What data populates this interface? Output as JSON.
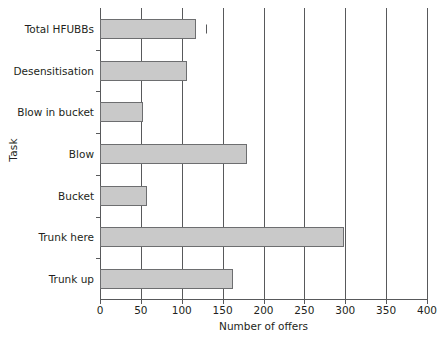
{
  "chart_data": {
    "type": "bar",
    "orientation": "horizontal",
    "title": "",
    "xlabel": "Number of offers",
    "ylabel": "Task",
    "xlim": [
      0,
      400
    ],
    "ylim": null,
    "grid": true,
    "legend": null,
    "categories": [
      "Trunk up",
      "Trunk here",
      "Bucket",
      "Blow",
      "Blow in bucket",
      "Desensitisation",
      "Total HFUBBs"
    ],
    "values": [
      163,
      298,
      57,
      180,
      53,
      107,
      117
    ],
    "xticks": [
      0,
      50,
      100,
      150,
      200,
      250,
      300,
      350,
      400
    ],
    "xticklabels": [
      "0",
      "50",
      "100",
      "150",
      "200",
      "250",
      "300",
      "350",
      "400"
    ],
    "annotations": [
      {
        "name": "tick-mark-total-hfubbs",
        "category": "Total HFUBBs",
        "x": 130,
        "text": ""
      }
    ],
    "colors": {
      "bar_fill": "#c9c9c9",
      "bar_stroke": "#6d6e70",
      "axis": "#58595b",
      "text": "#231f20",
      "background": "#ffffff"
    }
  }
}
